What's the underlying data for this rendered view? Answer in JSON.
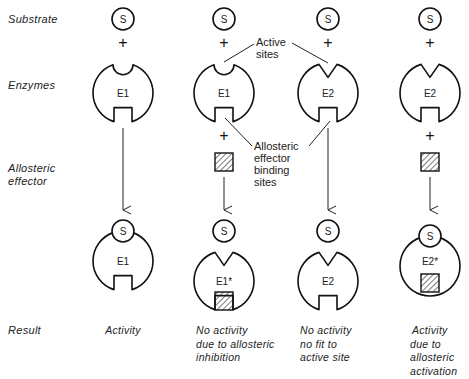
{
  "row_labels": {
    "substrate": "Substrate",
    "enzymes": "Enzymes",
    "effector_line1": "Allosteric",
    "effector_line2": "effector",
    "result": "Result"
  },
  "symbols": {
    "substrate": "S",
    "plus": "+"
  },
  "callouts": {
    "active_sites_line1": "Active",
    "active_sites_line2": "sites",
    "allosteric_line1": "Allosteric",
    "allosteric_line2": "effector",
    "allosteric_line3": "binding",
    "allosteric_line4": "sites"
  },
  "columns": [
    {
      "enzyme_before": "E1",
      "enzyme_after": "E1",
      "has_effector": false,
      "result_lines": [
        "Activity"
      ]
    },
    {
      "enzyme_before": "E1",
      "enzyme_after": "E1*",
      "has_effector": true,
      "result_lines": [
        "No activity",
        "due to allosteric",
        "inhibition"
      ]
    },
    {
      "enzyme_before": "E2",
      "enzyme_after": "E2",
      "has_effector": false,
      "result_lines": [
        "No activity",
        "no fit to",
        "active site"
      ]
    },
    {
      "enzyme_before": "E2",
      "enzyme_after": "E2*",
      "has_effector": true,
      "result_lines": [
        "Activity",
        "due to",
        "allosteric",
        "activation"
      ]
    }
  ]
}
